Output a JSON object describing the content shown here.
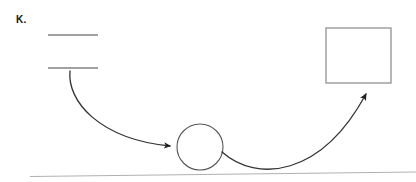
{
  "figure": {
    "panel_label": "K.",
    "width": 416,
    "height": 182,
    "background_color": "#ffffff"
  },
  "colors": {
    "stroke_dark": "#333333",
    "stroke_gray": "#808080",
    "stroke_light": "#b0b0b0",
    "label_text": "#111111"
  },
  "diagram": {
    "type": "schematic",
    "elements": [
      {
        "name": "upper-ledge-line",
        "shape": "line",
        "x1": 48,
        "y1": 35,
        "x2": 98,
        "y2": 35,
        "stroke": "#808080",
        "stroke_width": 1.6
      },
      {
        "name": "lower-ledge-line",
        "shape": "line",
        "x1": 48,
        "y1": 68,
        "x2": 98,
        "y2": 68,
        "stroke": "#808080",
        "stroke_width": 1.6
      },
      {
        "name": "descending-trajectory-arrow",
        "shape": "curved-arrow",
        "path": "M 70 71 C 68 100, 98 138, 172 146",
        "stroke": "#333333",
        "stroke_width": 1.3,
        "arrowhead_at": {
          "x": 177,
          "y": 147
        }
      },
      {
        "name": "circle-body",
        "shape": "circle",
        "cx": 200,
        "cy": 147,
        "r": 23,
        "stroke": "#555555",
        "stroke_width": 1.1,
        "fill": "none"
      },
      {
        "name": "ascending-trajectory-arrow",
        "shape": "curved-arrow",
        "path": "M 222 152 C 258 182, 320 176, 366 92",
        "stroke": "#333333",
        "stroke_width": 1.3,
        "arrowhead_at": {
          "x": 368,
          "y": 84
        }
      },
      {
        "name": "target-rectangle",
        "shape": "rect",
        "x": 326,
        "y": 28,
        "width": 65,
        "height": 55,
        "stroke": "#999999",
        "stroke_width": 1.4,
        "fill": "none"
      },
      {
        "name": "ground-line",
        "shape": "line",
        "x1": 30,
        "y1": 176,
        "x2": 416,
        "y2": 172,
        "stroke": "#b0b0b0",
        "stroke_width": 1.2
      }
    ]
  }
}
